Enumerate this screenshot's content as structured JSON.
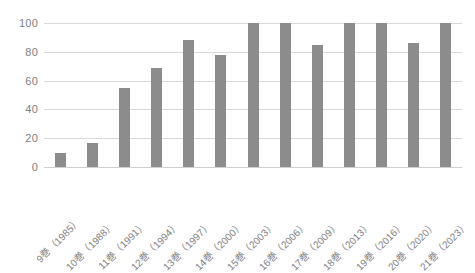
{
  "chart_data": {
    "type": "bar",
    "title": "",
    "subtitle": "",
    "xlabel": "",
    "ylabel": "",
    "ylim": [
      0,
      100
    ],
    "ytick_step": 20,
    "grid": true,
    "legend": false,
    "bar_color": "#8c8c8c",
    "gridline_color": "#d9d9d9",
    "tick_label_color": "#7f7f7f",
    "background_color": "#ffffff",
    "xtick_rotation": -45,
    "ytick_labels": [
      "100",
      "80",
      "60",
      "40",
      "20",
      "0"
    ],
    "ytick_values": [
      100,
      80,
      60,
      40,
      20,
      0
    ],
    "categories": [
      "9巻（1985）",
      "10巻（1988）",
      "11巻（1991）",
      "12巻（1994）",
      "13巻（1997）",
      "14巻（2000）",
      "15巻（2003）",
      "16巻（2006）",
      "17巻（2009）",
      "18巻（2013）",
      "19巻（2016）",
      "20巻（2020）",
      "21巻（2023）"
    ],
    "values": [
      10,
      17,
      55,
      69,
      88,
      78,
      100,
      100,
      85,
      100,
      100,
      86,
      100
    ]
  }
}
